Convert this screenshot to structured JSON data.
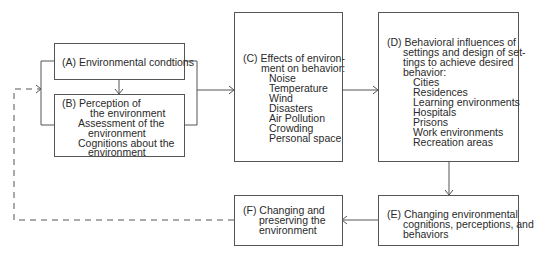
{
  "diagram": {
    "boxes": {
      "A": {
        "label": "(A) Environmental condtions"
      },
      "B": {
        "lines": [
          "(B) Perception of",
          "the environment",
          "Assessment of the",
          "environment",
          "Cognitions about the",
          "environment"
        ]
      },
      "C": {
        "lines": [
          "(C) Effects of environ-",
          "ment on behavior:",
          "Noise",
          "Temperature",
          "Wind",
          "Disasters",
          "Air Pollution",
          "Crowding",
          "Personal space"
        ]
      },
      "D": {
        "lines": [
          "(D) Behavioral influences of",
          "settings and design of set-",
          "tings to achieve desired",
          "behavior:",
          "Cities",
          "Residences",
          "Learning environments",
          "Hospitals",
          "Prisons",
          "Work environments",
          "Recreation areas"
        ]
      },
      "E": {
        "lines": [
          "(E) Changing environmental",
          "cognitions, perceptions, and",
          "behaviors"
        ]
      },
      "F": {
        "lines": [
          "(F) Changing and",
          "preserving the",
          "environment"
        ]
      }
    },
    "edges": [
      {
        "from": "A",
        "to": "B",
        "style": "solid"
      },
      {
        "from": "A+B",
        "to": "C",
        "style": "solid"
      },
      {
        "from": "C",
        "to": "D",
        "style": "solid"
      },
      {
        "from": "D",
        "to": "E",
        "style": "solid"
      },
      {
        "from": "E",
        "to": "F",
        "style": "solid"
      },
      {
        "from": "F",
        "to": "A+B",
        "style": "dashed"
      }
    ],
    "colors": {
      "line": "#555555",
      "text": "#2a2a2a",
      "background": "#ffffff"
    }
  }
}
